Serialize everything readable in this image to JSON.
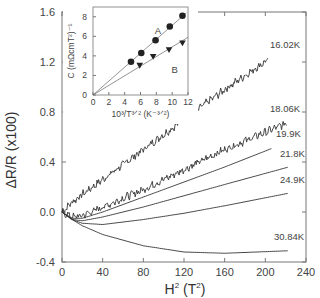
{
  "chart_data": {
    "type": "line",
    "title": "",
    "xlabel": "H² (T²)",
    "ylabel": "ΔR/R (x100)",
    "xlim": [
      0,
      240
    ],
    "ylim": [
      -0.4,
      1.6
    ],
    "xticks": [
      "0",
      "40",
      "80",
      "120",
      "160",
      "200",
      "240"
    ],
    "yticks": [
      "1.6",
      "1.2",
      "0.8",
      "0.4",
      "0.0",
      "-0.4"
    ],
    "grid": false,
    "series": [
      {
        "name": "16.02K",
        "x": [
          0,
          10,
          20,
          40,
          80,
          120,
          160,
          203
        ],
        "values": [
          0.0,
          0.08,
          0.14,
          0.26,
          0.5,
          0.74,
          0.98,
          1.22
        ],
        "noisy": true
      },
      {
        "name": "18.06K",
        "x": [
          0,
          10,
          20,
          40,
          80,
          120,
          160,
          221
        ],
        "values": [
          0.0,
          -0.04,
          -0.03,
          0.04,
          0.18,
          0.34,
          0.5,
          0.71
        ],
        "noisy": true
      },
      {
        "name": "19.9K",
        "x": [
          0,
          10,
          20,
          40,
          80,
          120,
          160,
          207
        ],
        "values": [
          0.0,
          -0.05,
          -0.05,
          0.0,
          0.12,
          0.24,
          0.36,
          0.51
        ]
      },
      {
        "name": "21.8K",
        "x": [
          0,
          10,
          20,
          40,
          80,
          120,
          160,
          223
        ],
        "values": [
          0.0,
          -0.06,
          -0.07,
          -0.04,
          0.04,
          0.13,
          0.22,
          0.36
        ]
      },
      {
        "name": "24.9K",
        "x": [
          0,
          10,
          20,
          40,
          80,
          120,
          160,
          223
        ],
        "values": [
          0.0,
          -0.06,
          -0.09,
          -0.1,
          -0.06,
          -0.01,
          0.05,
          0.15
        ]
      },
      {
        "name": "30.84K",
        "x": [
          0,
          10,
          20,
          40,
          80,
          120,
          160,
          223
        ],
        "values": [
          0.0,
          -0.06,
          -0.11,
          -0.18,
          -0.27,
          -0.32,
          -0.33,
          -0.31
        ]
      }
    ],
    "inset": {
      "type": "scatter+line",
      "xlabel": "10³/T^{3/2} (K^{-3/2})",
      "ylabel": "C (mΩcmT²)⁻¹",
      "xlim": [
        0,
        12
      ],
      "ylim": [
        0,
        9
      ],
      "xticks": [
        "0",
        "2",
        "4",
        "6",
        "8",
        "10",
        "12"
      ],
      "yticks": [
        "0",
        "2",
        "4",
        "6",
        "8"
      ],
      "series": [
        {
          "name": "A",
          "marker": "circle",
          "x": [
            4.8,
            6.1,
            7.9,
            9.7,
            11.3
          ],
          "values": [
            3.4,
            4.3,
            5.6,
            7.0,
            8.1
          ],
          "fit": {
            "x": [
              0,
              11.8
            ],
            "y": [
              0,
              8.4
            ]
          }
        },
        {
          "name": "B",
          "marker": "triangle-down",
          "x": [
            5.9,
            7.6,
            9.6,
            11.3
          ],
          "values": [
            3.0,
            3.9,
            4.6,
            5.3
          ],
          "fit": {
            "x": [
              0,
              12
            ],
            "y": [
              0,
              5.9
            ]
          }
        }
      ]
    }
  },
  "labels": {
    "xlabel_main": "H",
    "xlabel_sup": "2",
    "xlabel_unit": "(T",
    "xlabel_unit_sup": "2",
    "xlabel_close": ")",
    "ylabel": "ΔR/R (x100)",
    "curves": [
      "16.02K",
      "18.06K",
      "19.9K",
      "21.8K",
      "24.9K",
      "30.84K"
    ],
    "inset_A": "A",
    "inset_B": "B",
    "inset_xlabel": "10³/T³ᐟ² (K⁻³ᐟ²)",
    "inset_ylabel": "C (mΩcmT²)⁻¹"
  }
}
